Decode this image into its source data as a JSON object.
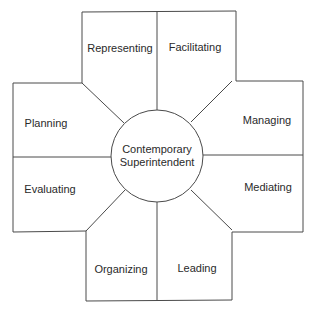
{
  "diagram": {
    "type": "radial role diagram",
    "center": {
      "line1": "Contemporary",
      "line2": "Superintendent"
    },
    "segments": [
      {
        "id": "representing",
        "label": "Representing",
        "position": "top-left"
      },
      {
        "id": "facilitating",
        "label": "Facilitating",
        "position": "top-right"
      },
      {
        "id": "managing",
        "label": "Managing",
        "position": "right-top"
      },
      {
        "id": "mediating",
        "label": "Mediating",
        "position": "right-bottom"
      },
      {
        "id": "leading",
        "label": "Leading",
        "position": "bottom-right"
      },
      {
        "id": "organizing",
        "label": "Organizing",
        "position": "bottom-left"
      },
      {
        "id": "evaluating",
        "label": "Evaluating",
        "position": "left-bottom"
      },
      {
        "id": "planning",
        "label": "Planning",
        "position": "left-top"
      }
    ],
    "colors": {
      "stroke": "#4a4a4a",
      "text": "#2a2a2a",
      "background": "#ffffff"
    }
  }
}
